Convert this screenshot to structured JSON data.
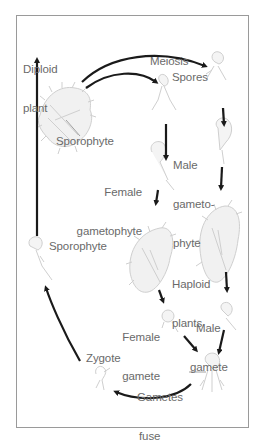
{
  "diagram": {
    "colors": {
      "arrow": "#1a1a1a",
      "text": "#6a6a6a",
      "frame": "#9a9a9a",
      "organism": "#cfcfcf"
    },
    "labels": {
      "diploid_plant_1": "Diploid",
      "diploid_plant_2": "plant",
      "sporophyte_top": "Sporophyte",
      "meiosis": "Meiosis",
      "spores": "Spores",
      "male_gametophyte_1": "Male",
      "male_gametophyte_2": "gameto-",
      "male_gametophyte_3": "phyte",
      "female_gametophyte_1": "Female",
      "female_gametophyte_2": "gametophyte",
      "haploid_plants_1": "Haploid",
      "haploid_plants_2": "plants",
      "sporophyte_left": "Sporophyte",
      "female_gamete_1": "Female",
      "female_gamete_2": "gamete",
      "male_gamete_1": "Male",
      "male_gamete_2": "gamete",
      "zygote": "Zygote",
      "gametes_fuse_1": "Gametes",
      "gametes_fuse_2": "fuse"
    },
    "stages": [
      "Diploid plant (Sporophyte)",
      "Meiosis",
      "Spores",
      "Female gametophyte",
      "Male gametophyte",
      "Haploid plants",
      "Female gamete",
      "Male gamete",
      "Gametes fuse",
      "Zygote",
      "Sporophyte"
    ]
  }
}
